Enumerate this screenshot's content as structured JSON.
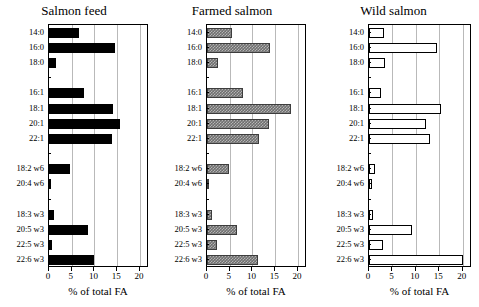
{
  "figure": {
    "width": 479,
    "height": 307,
    "background": "#ffffff"
  },
  "chart_data": {
    "type": "bar",
    "orientation": "horizontal",
    "title": "",
    "xlabel": "% of total FA",
    "ylabel": "",
    "xlim": [
      0,
      22
    ],
    "ticks": [
      0,
      5,
      10,
      15,
      20
    ],
    "tick_labels": [
      "0",
      "5",
      "10",
      "15",
      "20"
    ],
    "grid": true,
    "grid_axis": "x",
    "legend": "none",
    "categories": [
      "14:0",
      "16:0",
      "18:0",
      "",
      "16:1",
      "18:1",
      "20:1",
      "22:1",
      "",
      "18:2 w6",
      "20:4 w6",
      "",
      "18:3 w3",
      "20:5 w3",
      "22:5 w3",
      "22:6 w3"
    ],
    "panels": [
      {
        "title": "Salmon feed",
        "fill": "solid-black",
        "fill_color": "#000000",
        "xlabel": "% of total FA",
        "values": [
          6.5,
          14.5,
          1.6,
          null,
          7.8,
          14.1,
          15.7,
          13.9,
          null,
          4.6,
          0.4,
          null,
          1.1,
          8.6,
          0.7,
          9.8
        ]
      },
      {
        "title": "Farmed salmon",
        "fill": "gray-hatched",
        "fill_color": "#6f6f6f",
        "xlabel": "% of total FA",
        "values": [
          5.6,
          13.9,
          2.4,
          null,
          8.0,
          18.5,
          13.7,
          11.5,
          null,
          4.8,
          0.4,
          null,
          1.2,
          6.5,
          2.1,
          11.2
        ]
      },
      {
        "title": "Wild salmon",
        "fill": "open-white",
        "fill_color": "#ffffff",
        "xlabel": "% of total FA",
        "values": [
          3.2,
          14.5,
          3.5,
          null,
          2.5,
          15.4,
          12.2,
          13.1,
          null,
          1.2,
          0.7,
          null,
          0.8,
          9.1,
          3.0,
          20.1
        ]
      }
    ],
    "series": [
      {
        "name": "Salmon feed",
        "values": [
          6.5,
          14.5,
          1.6,
          null,
          7.8,
          14.1,
          15.7,
          13.9,
          null,
          4.6,
          0.4,
          null,
          1.1,
          8.6,
          0.7,
          9.8
        ]
      },
      {
        "name": "Farmed salmon",
        "values": [
          5.6,
          13.9,
          2.4,
          null,
          8.0,
          18.5,
          13.7,
          11.5,
          null,
          4.8,
          0.4,
          null,
          1.2,
          6.5,
          2.1,
          11.2
        ]
      },
      {
        "name": "Wild salmon",
        "values": [
          3.2,
          14.5,
          3.5,
          null,
          2.5,
          15.4,
          12.2,
          13.1,
          null,
          1.2,
          0.7,
          null,
          0.8,
          9.1,
          3.0,
          20.1
        ]
      }
    ]
  }
}
